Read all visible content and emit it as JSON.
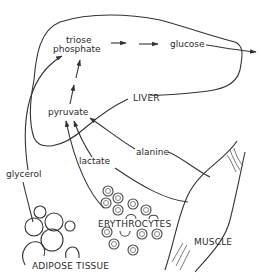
{
  "diagram": {
    "type": "metabolic-pathway",
    "nodes": {
      "triose_phosphate_line1": "triose",
      "triose_phosphate_line2": "phosphate",
      "glucose": "glucose",
      "pyruvate": "pyruvate",
      "lactate": "lactate",
      "alanine": "alanine",
      "glycerol": "glycerol"
    },
    "compartments": {
      "liver": "LIVER",
      "erythrocytes": "ERYTHROCYTES",
      "muscle": "MUSCLE",
      "adipose_tissue": "ADIPOSE TISSUE"
    },
    "edges": [
      {
        "from": "triose phosphate",
        "to": "glucose",
        "style": "dashed-arrow"
      },
      {
        "from": "pyruvate",
        "to": "triose phosphate",
        "style": "dashed-arrow"
      },
      {
        "from": "lactate",
        "to": "pyruvate",
        "style": "arrow"
      },
      {
        "from": "alanine",
        "to": "pyruvate",
        "style": "arrow"
      },
      {
        "from": "glycerol",
        "to": "triose phosphate",
        "style": "arrow"
      },
      {
        "from": "glucose",
        "to": "exit",
        "style": "arrow"
      }
    ],
    "colors": {
      "line": "#333333",
      "background": "#ffffff"
    }
  }
}
